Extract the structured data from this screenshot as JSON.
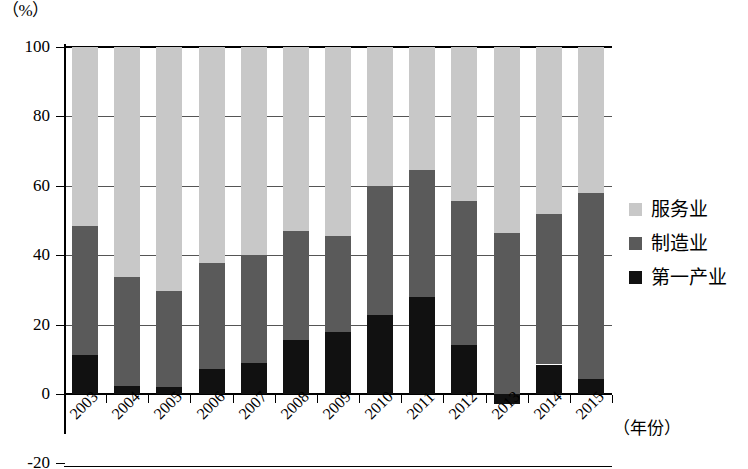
{
  "chart_data": {
    "type": "bar",
    "subtype": "stacked-column",
    "title": "",
    "unit_caption": "（%）",
    "xlabel": "（年份）",
    "ylabel": "",
    "ylim": [
      -20,
      100
    ],
    "yticks": [
      -20,
      0,
      20,
      40,
      60,
      80,
      100
    ],
    "ytick_labels": [
      "-20",
      "0",
      "20",
      "40",
      "60",
      "80",
      "100"
    ],
    "grid": true,
    "legend_position": "right",
    "categories": [
      "2003",
      "2004",
      "2005",
      "2006",
      "2007",
      "2008",
      "2009",
      "2010",
      "2011",
      "2012",
      "2013",
      "2014",
      "2015"
    ],
    "series": [
      {
        "name": "第一产业",
        "color": "#111111",
        "values": [
          11.3,
          2.3,
          2.0,
          7.2,
          9.0,
          15.5,
          17.8,
          22.8,
          28.0,
          14.0,
          -3.0,
          8.5,
          4.3
        ]
      },
      {
        "name": "制造业",
        "color": "#5a5a5a",
        "values": [
          37.2,
          31.5,
          27.8,
          30.6,
          31.2,
          31.5,
          27.7,
          37.2,
          36.5,
          41.5,
          49.5,
          43.5,
          53.7
        ]
      },
      {
        "name": "服务业",
        "color": "#c8c8c8",
        "values": [
          51.5,
          66.2,
          70.2,
          62.2,
          59.8,
          53.0,
          54.5,
          40.0,
          35.5,
          44.5,
          53.5,
          48.0,
          42.0
        ]
      }
    ],
    "cumulative_tops": {
      "note": "stack tops read off the gridlines",
      "primary_top": [
        11.3,
        2.3,
        2.0,
        7.2,
        9.0,
        15.5,
        17.8,
        22.8,
        28.0,
        14.0,
        -3.0,
        8.5,
        4.3
      ],
      "manufacturing_top": [
        48.5,
        33.8,
        29.8,
        37.8,
        40.2,
        47.0,
        45.5,
        60.0,
        64.5,
        55.5,
        46.5,
        52.0,
        58.0
      ],
      "services_top": [
        100,
        100,
        100,
        100,
        100,
        100,
        100,
        100,
        100,
        100,
        100,
        100,
        100
      ]
    }
  },
  "legend": {
    "items": [
      {
        "label": "服务业",
        "color": "#c8c8c8"
      },
      {
        "label": "制造业",
        "color": "#5a5a5a"
      },
      {
        "label": "第一产业",
        "color": "#111111"
      }
    ]
  }
}
